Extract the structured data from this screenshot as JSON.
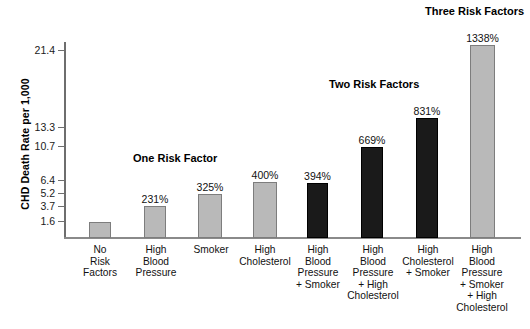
{
  "chart_data": {
    "type": "bar",
    "title": "",
    "ylabel": "CHD Death Rate per 1,000",
    "xlabel": "",
    "grid": false,
    "legend": "none",
    "ylim": [
      0,
      23.5
    ],
    "ytick_values": [
      1.6,
      3.7,
      5.2,
      6.4,
      10.7,
      13.3,
      21.4
    ],
    "ytick_labels": [
      "1.6",
      "3.7",
      "5.2",
      "6.4",
      "10.7",
      "13.3",
      "21.4"
    ],
    "categories": [
      "No Risk Factors",
      "High Blood Pressure",
      "Smoker",
      "High Cholesterol",
      "High Blood Pressure + Smoker",
      "High Blood Pressure + High Cholesterol",
      "High Cholesterol + Smoker",
      "High Blood Pressure + Smoker + High Cholesterol"
    ],
    "category_lines": [
      [
        "No",
        "Risk",
        "Factors"
      ],
      [
        "High",
        "Blood",
        "Pressure"
      ],
      [
        "Smoker"
      ],
      [
        "High",
        "Cholesterol"
      ],
      [
        "High",
        "Blood",
        "Pressure",
        "+ Smoker"
      ],
      [
        "High",
        "Blood",
        "Pressure",
        "+ High",
        "Cholesterol"
      ],
      [
        "High",
        "Cholesterol",
        "+ Smoker"
      ],
      [
        "High",
        "Blood",
        "Pressure",
        "+ Smoker",
        "+ High",
        "Cholesterol"
      ]
    ],
    "values": [
      1.6,
      3.7,
      5.2,
      6.4,
      6.3,
      10.7,
      13.3,
      21.4
    ],
    "value_labels": [
      "",
      "231%",
      "325%",
      "400%",
      "394%",
      "669%",
      "831%",
      "1338%"
    ],
    "bar_colors": [
      "gray",
      "gray",
      "gray",
      "gray",
      "black",
      "black",
      "black",
      "gray"
    ],
    "annotations": [
      {
        "text": "One Risk Factor",
        "x": 133,
        "y": 152
      },
      {
        "text": "Two Risk Factors",
        "x": 329,
        "y": 78
      },
      {
        "text": "Three Risk Factors",
        "x": 425,
        "y": 5
      }
    ],
    "colors": {
      "gray_bar": "#b9b9b9",
      "black_bar": "#1a1a1a",
      "axis": "#6e6e6e",
      "text": "#111111",
      "background": "#ffffff"
    }
  },
  "layout": {
    "bars": [
      {
        "left": 89,
        "width": 22,
        "top": 222,
        "label_top": 209
      },
      {
        "left": 144,
        "width": 22,
        "top": 206,
        "label_top": 193
      },
      {
        "left": 198,
        "width": 24,
        "top": 194,
        "label_top": 181
      },
      {
        "left": 253,
        "width": 24,
        "top": 182,
        "label_top": 169
      },
      {
        "left": 307,
        "width": 21,
        "top": 183,
        "label_top": 170
      },
      {
        "left": 361,
        "width": 22,
        "top": 147,
        "label_top": 134
      },
      {
        "left": 416,
        "width": 22,
        "top": 118,
        "label_top": 105
      },
      {
        "left": 470,
        "width": 25,
        "top": 45,
        "label_top": 32
      }
    ],
    "category_blocks": [
      {
        "left": 74,
        "width": 52
      },
      {
        "left": 128,
        "width": 56
      },
      {
        "left": 182,
        "width": 58
      },
      {
        "left": 233,
        "width": 64
      },
      {
        "left": 288,
        "width": 60
      },
      {
        "left": 342,
        "width": 62
      },
      {
        "left": 394,
        "width": 68
      },
      {
        "left": 450,
        "width": 64
      }
    ],
    "y_tick_positions": [
      {
        "value": "21.4",
        "top": 50
      },
      {
        "value": "13.3",
        "top": 127
      },
      {
        "value": "10.7",
        "top": 146
      },
      {
        "value": "6.4",
        "top": 180
      },
      {
        "value": "5.2",
        "top": 193
      },
      {
        "value": "3.7",
        "top": 206
      },
      {
        "value": "1.6",
        "top": 221
      }
    ]
  }
}
